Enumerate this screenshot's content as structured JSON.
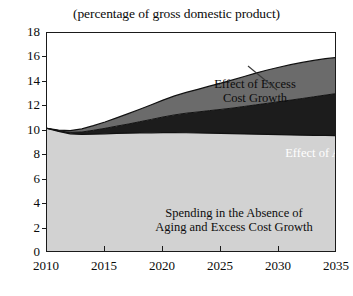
{
  "chart_data": {
    "type": "area",
    "title": "(percentage of gross domestic product)",
    "xlabel": "",
    "ylabel": "",
    "xlim": [
      2010,
      2035
    ],
    "ylim": [
      0,
      18
    ],
    "grid": false,
    "legend_position": "inline-annotations",
    "stacked": true,
    "xticks": [
      2010,
      2015,
      2020,
      2025,
      2030,
      2035
    ],
    "yticks": [
      0,
      2,
      4,
      6,
      8,
      10,
      12,
      14,
      16,
      18
    ],
    "x": [
      2010,
      2011,
      2012,
      2013,
      2014,
      2015,
      2016,
      2017,
      2018,
      2019,
      2020,
      2021,
      2022,
      2023,
      2024,
      2025,
      2026,
      2027,
      2028,
      2029,
      2030,
      2031,
      2032,
      2033,
      2034,
      2035
    ],
    "series": [
      {
        "name": "Spending in the Absence of Aging and Excess Cost Growth",
        "color": "#d2d2d2",
        "values": [
          10.2,
          9.95,
          9.75,
          9.7,
          9.72,
          9.75,
          9.78,
          9.8,
          9.82,
          9.83,
          9.85,
          9.85,
          9.84,
          9.82,
          9.8,
          9.78,
          9.76,
          9.74,
          9.72,
          9.7,
          9.68,
          9.66,
          9.64,
          9.63,
          9.62,
          9.6
        ]
      },
      {
        "name": "Effect of Aging",
        "color": "#1c1c1c",
        "values": [
          0.0,
          0.05,
          0.12,
          0.2,
          0.32,
          0.45,
          0.6,
          0.75,
          0.92,
          1.1,
          1.28,
          1.45,
          1.6,
          1.72,
          1.85,
          1.97,
          2.1,
          2.25,
          2.4,
          2.55,
          2.7,
          2.85,
          3.0,
          3.15,
          3.3,
          3.45
        ]
      },
      {
        "name": "Effect of Excess Cost Growth",
        "color": "#6b6b6b",
        "values": [
          0.0,
          0.06,
          0.15,
          0.25,
          0.38,
          0.52,
          0.68,
          0.85,
          1.02,
          1.2,
          1.38,
          1.55,
          1.7,
          1.85,
          2.0,
          2.15,
          2.3,
          2.45,
          2.6,
          2.72,
          2.82,
          2.9,
          2.95,
          2.98,
          2.98,
          2.95
        ]
      }
    ],
    "totals": [
      10.2,
      10.06,
      10.02,
      10.15,
      10.42,
      10.72,
      11.06,
      11.4,
      11.76,
      12.13,
      12.51,
      12.85,
      13.14,
      13.39,
      13.65,
      13.9,
      14.16,
      14.44,
      14.72,
      14.97,
      15.2,
      15.41,
      15.59,
      15.76,
      15.9,
      16.0
    ],
    "annotations": [
      {
        "id": "excess",
        "text": "Effect of Excess\nCost Growth",
        "color": "#0d0d0d"
      },
      {
        "id": "aging",
        "text": "Effect of Aging",
        "color": "#ffffff"
      },
      {
        "id": "baseline",
        "text": "Spending in the Absence of\nAging and Excess Cost Growth",
        "color": "#0d0d0d"
      }
    ],
    "leader_line": {
      "from": [
        248,
        66
      ],
      "to": [
        277,
        90
      ],
      "color": "#3a3a3a"
    }
  }
}
